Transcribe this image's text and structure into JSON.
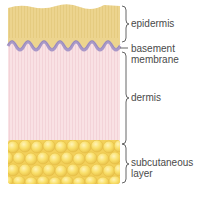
{
  "colors": {
    "epidermis": "#ecd48e",
    "epidermis_stripe": "#e3c878",
    "basement_membrane": "#a998c8",
    "basement_outline": "#8c7fb0",
    "dermis": "#f8dfe2",
    "dermis_stripe": "#f1d0d5",
    "fat": "#f8dc64",
    "fat_highlight": "#fdf0a8",
    "fat_shadow": "#e8c040",
    "bracket": "#555555",
    "label_text": "#4a4a4a"
  },
  "labels": {
    "epidermis": {
      "lines": [
        "epidermis"
      ]
    },
    "basement_membrane": {
      "lines": [
        "basement",
        "membrane"
      ]
    },
    "dermis": {
      "lines": [
        "dermis"
      ]
    },
    "subcutaneous_layer": {
      "lines": [
        "subcutaneous",
        "layer"
      ]
    }
  }
}
